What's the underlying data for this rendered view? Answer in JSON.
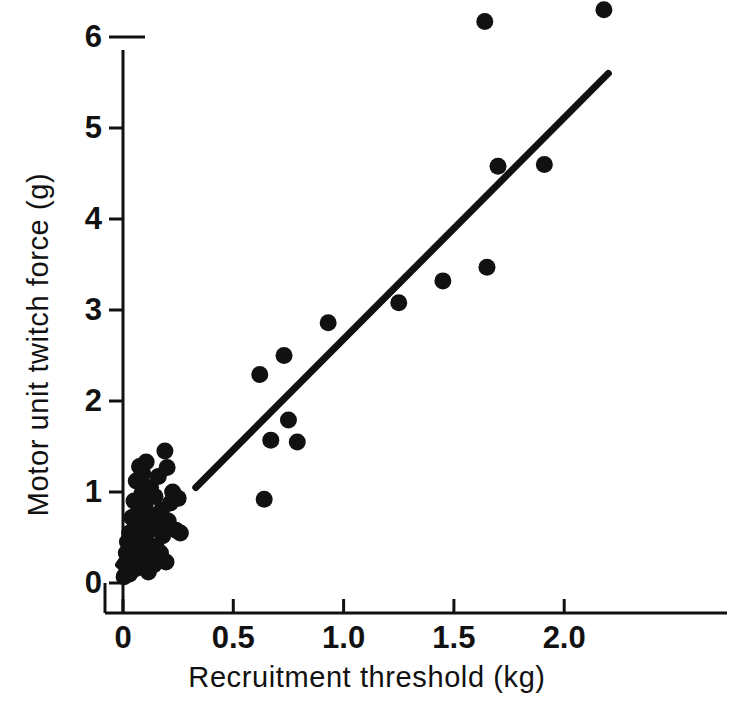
{
  "chart_data": {
    "type": "scatter",
    "title": "",
    "xlabel": "Recruitment threshold (kg)",
    "ylabel": "Motor unit twitch force (g)",
    "xlim": [
      -0.06,
      2.28
    ],
    "ylim": [
      -0.18,
      6.45
    ],
    "xticks": [
      0,
      0.5,
      1.0,
      1.5,
      2.0
    ],
    "xtick_labels": [
      "0",
      "0.5",
      "1.0",
      "1.5",
      "2.0"
    ],
    "yticks": [
      0,
      1,
      2,
      3,
      4,
      5,
      6
    ],
    "ytick_labels": [
      "0",
      "1",
      "2",
      "3",
      "4",
      "5",
      "6"
    ],
    "grid": false,
    "legend": null,
    "marker": "filled-circle",
    "marker_color": "#111111",
    "marker_size_px": 17,
    "points": [
      [
        0.005,
        0.07
      ],
      [
        0.01,
        0.2
      ],
      [
        0.015,
        0.33
      ],
      [
        0.02,
        0.12
      ],
      [
        0.02,
        0.45
      ],
      [
        0.025,
        0.26
      ],
      [
        0.03,
        0.55
      ],
      [
        0.03,
        0.1
      ],
      [
        0.035,
        0.38
      ],
      [
        0.04,
        0.72
      ],
      [
        0.04,
        0.22
      ],
      [
        0.045,
        0.48
      ],
      [
        0.05,
        0.3
      ],
      [
        0.05,
        0.9
      ],
      [
        0.055,
        0.62
      ],
      [
        0.06,
        0.16
      ],
      [
        0.06,
        1.12
      ],
      [
        0.065,
        0.42
      ],
      [
        0.07,
        0.78
      ],
      [
        0.07,
        0.28
      ],
      [
        0.075,
        1.28
      ],
      [
        0.08,
        0.52
      ],
      [
        0.08,
        0.18
      ],
      [
        0.085,
        0.98
      ],
      [
        0.09,
        0.35
      ],
      [
        0.09,
        1.2
      ],
      [
        0.095,
        0.66
      ],
      [
        0.1,
        0.25
      ],
      [
        0.1,
        0.85
      ],
      [
        0.105,
        1.33
      ],
      [
        0.11,
        0.44
      ],
      [
        0.115,
        0.12
      ],
      [
        0.12,
        0.58
      ],
      [
        0.125,
        1.05
      ],
      [
        0.13,
        0.3
      ],
      [
        0.135,
        0.74
      ],
      [
        0.14,
        0.2
      ],
      [
        0.145,
        0.95
      ],
      [
        0.15,
        0.4
      ],
      [
        0.155,
        0.6
      ],
      [
        0.16,
        1.17
      ],
      [
        0.17,
        0.33
      ],
      [
        0.175,
        0.8
      ],
      [
        0.18,
        0.52
      ],
      [
        0.19,
        1.45
      ],
      [
        0.195,
        0.23
      ],
      [
        0.2,
        1.27
      ],
      [
        0.205,
        0.68
      ],
      [
        0.215,
        0.88
      ],
      [
        0.225,
        1.0
      ],
      [
        0.24,
        0.58
      ],
      [
        0.25,
        0.93
      ],
      [
        0.26,
        0.55
      ],
      [
        0.62,
        2.29
      ],
      [
        0.64,
        0.92
      ],
      [
        0.67,
        1.57
      ],
      [
        0.73,
        2.5
      ],
      [
        0.75,
        1.79
      ],
      [
        0.79,
        1.55
      ],
      [
        0.93,
        2.86
      ],
      [
        1.25,
        3.08
      ],
      [
        1.45,
        3.32
      ],
      [
        1.64,
        6.17
      ],
      [
        1.65,
        3.47
      ],
      [
        1.7,
        4.58
      ],
      [
        1.91,
        4.6
      ],
      [
        2.18,
        6.3
      ]
    ],
    "fit_line": {
      "label": "regression line",
      "x_start": 0.33,
      "y_start": 1.05,
      "x_end": 2.2,
      "y_end": 5.6,
      "style": "solid",
      "width_px": 7,
      "color": "#111111"
    },
    "dash_segment": {
      "label": "short dashed extension near origin",
      "x_start": -0.02,
      "y_start": 0.2,
      "x_end": 0.045,
      "y_end": 0.42,
      "style": "solid",
      "width_px": 7,
      "color": "#111111"
    }
  },
  "axes": {
    "axis_color": "#111111",
    "axis_width_px": 3,
    "tick_length_px": 14
  }
}
